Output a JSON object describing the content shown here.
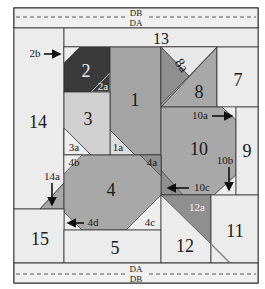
{
  "diagram": {
    "type": "quilt-block-piecing-diagram",
    "colors": {
      "white": "#ececec",
      "light": "#d0d0d0",
      "medium": "#a8a8a8",
      "mediumdark": "#8f8f8f",
      "dark": "#3a3a3a",
      "line": "#333333",
      "paper": "#f2f2f2"
    },
    "bands": {
      "top_upper": "DB",
      "top_lower": "DA",
      "bottom_upper": "DA",
      "bottom_lower": "DB"
    },
    "pieces": {
      "p1": "1",
      "p1a": "1a",
      "p2": "2",
      "p2a": "2a",
      "p2b": "2b",
      "p3": "3",
      "p3a": "3a",
      "p4": "4",
      "p4a": "4a",
      "p4b": "4b",
      "p4c": "4c",
      "p4d": "4d",
      "p5": "5",
      "p7": "7",
      "p8": "8",
      "p8a": "8a",
      "p9": "9",
      "p10": "10",
      "p10a": "10a",
      "p10b": "10b",
      "p10c": "10c",
      "p11": "11",
      "p12": "12",
      "p12a": "12a",
      "p13": "13",
      "p14": "14",
      "p14a": "14a",
      "p15": "15"
    }
  }
}
